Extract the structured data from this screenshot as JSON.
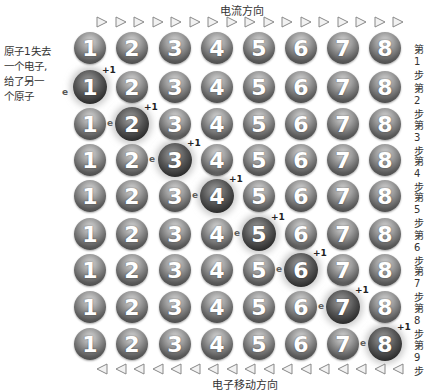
{
  "top_label": "电流方向",
  "bottom_label": "电子移动方向",
  "arrow_count": 17,
  "side_note": {
    "lines": [
      "原子1失去",
      "一个电子,",
      "给了另一",
      "个原子"
    ],
    "electron_symbol": "e"
  },
  "atom_numbers": [
    "1",
    "2",
    "3",
    "4",
    "5",
    "6",
    "7",
    "8"
  ],
  "ion_label": "+1",
  "electron_label": "e",
  "steps": [
    {
      "label": "第1步",
      "ion": null,
      "electron_after": null
    },
    {
      "label": "第2步",
      "ion": 1,
      "electron_after": null
    },
    {
      "label": "第3步",
      "ion": 2,
      "electron_after": 1
    },
    {
      "label": "第4步",
      "ion": 3,
      "electron_after": 2
    },
    {
      "label": "第5步",
      "ion": 4,
      "electron_after": 3
    },
    {
      "label": "第6步",
      "ion": 5,
      "electron_after": 4
    },
    {
      "label": "第7步",
      "ion": 6,
      "electron_after": 5
    },
    {
      "label": "第8步",
      "ion": 7,
      "electron_after": 6
    },
    {
      "label": "第9步",
      "ion": 8,
      "electron_after": 7
    }
  ]
}
